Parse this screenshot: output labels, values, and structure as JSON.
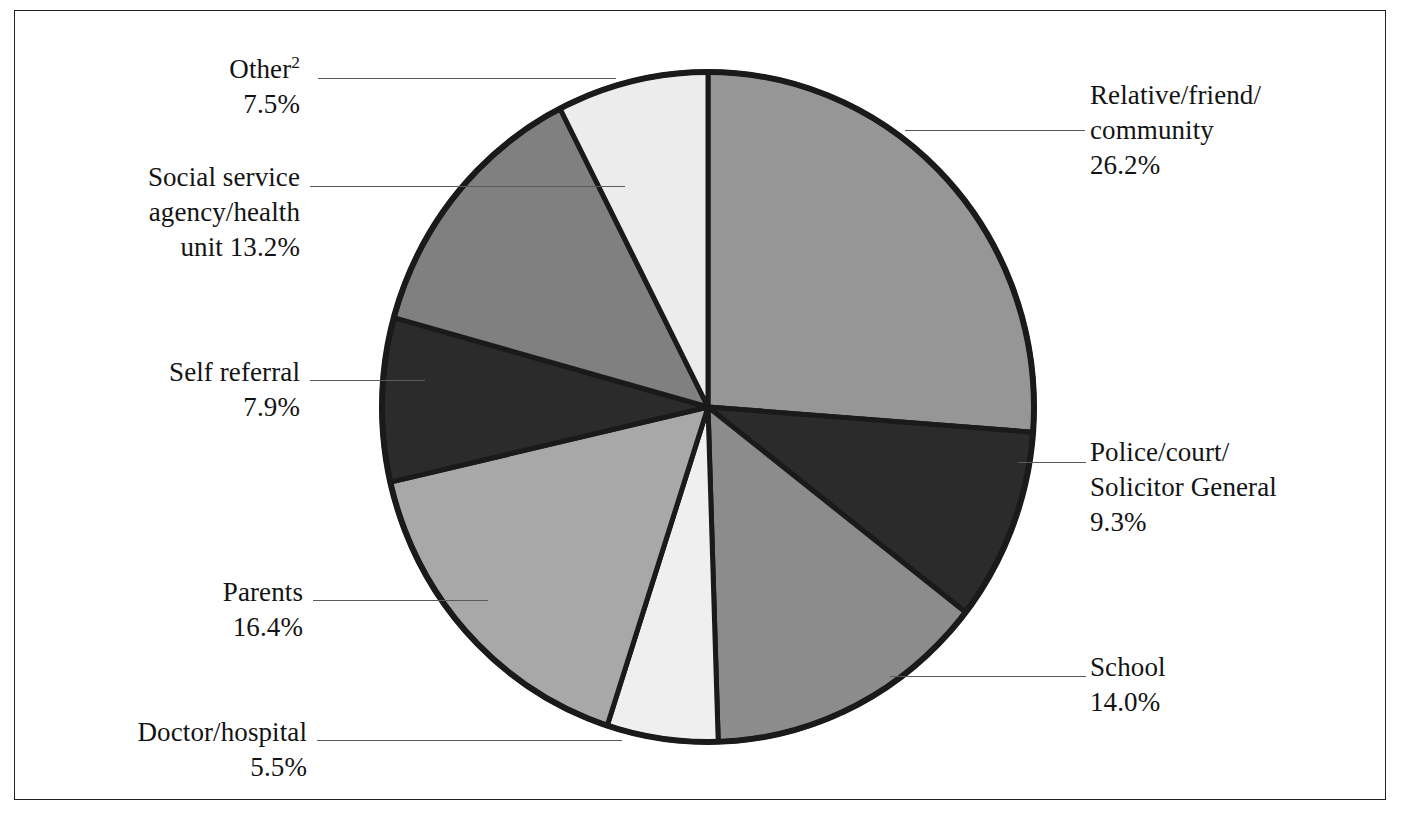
{
  "chart_data": {
    "type": "pie",
    "title": "",
    "subtitle": "",
    "xlabel": "",
    "ylabel": "",
    "legend_position": "callout-labels",
    "grid": false,
    "start_angle_deg": 0,
    "direction": "clockwise",
    "units": "percent",
    "total": 100.0,
    "categories": [
      "Relative/friend/community",
      "Police/court/Solicitor General",
      "School",
      "Doctor/hospital",
      "Parents",
      "Self referral",
      "Social service agency/health unit",
      "Other"
    ],
    "values": [
      26.2,
      9.3,
      14.0,
      5.5,
      16.4,
      7.9,
      13.2,
      7.5
    ],
    "colors": [
      "#969696",
      "#2b2b2b",
      "#8c8c8c",
      "#efefef",
      "#a8a8a8",
      "#2b2b2b",
      "#808080",
      "#ececec"
    ],
    "slices": [
      {
        "name": "relative-friend-community",
        "label_line1": "Relative/friend/",
        "label_line2": "community",
        "value_text": "26.2%",
        "value": 26.2,
        "color": "#969696",
        "side": "right"
      },
      {
        "name": "police-court-solicitor-general",
        "label_line1": "Police/court/",
        "label_line2": "Solicitor General",
        "value_text": "9.3%",
        "value": 9.3,
        "color": "#2b2b2b",
        "side": "right"
      },
      {
        "name": "school",
        "label_line1": "School",
        "label_line2": "",
        "value_text": "14.0%",
        "value": 14.0,
        "color": "#8c8c8c",
        "side": "right"
      },
      {
        "name": "doctor-hospital",
        "label_line1": "Doctor/hospital",
        "label_line2": "",
        "value_text": "5.5%",
        "value": 5.5,
        "color": "#efefef",
        "side": "left"
      },
      {
        "name": "parents",
        "label_line1": "Parents",
        "label_line2": "",
        "value_text": "16.4%",
        "value": 16.4,
        "color": "#a8a8a8",
        "side": "left"
      },
      {
        "name": "self-referral",
        "label_line1": "Self referral",
        "label_line2": "",
        "value_text": "7.9%",
        "value": 7.9,
        "color": "#2b2b2b",
        "side": "left"
      },
      {
        "name": "social-service-agency-health-unit",
        "label_line1": "Social service",
        "label_line2": "agency/health",
        "label_line3": "unit 13.2%",
        "value_text": "13.2%",
        "value": 13.2,
        "color": "#808080",
        "side": "left"
      },
      {
        "name": "other",
        "label_line1": "Other",
        "label_line2": "",
        "value_text": "7.5%",
        "value": 7.5,
        "color": "#ececec",
        "side": "left",
        "footnote_marker": "2"
      }
    ]
  },
  "labels": {
    "relative": {
      "line1": "Relative/friend/",
      "line2": "community",
      "pct": "26.2%"
    },
    "police": {
      "line1": "Police/court/",
      "line2": "Solicitor General",
      "pct": "9.3%"
    },
    "school": {
      "line1": "School",
      "pct": "14.0%"
    },
    "doctor": {
      "line1": "Doctor/hospital",
      "pct": "5.5%"
    },
    "parents": {
      "line1": "Parents",
      "pct": "16.4%"
    },
    "self": {
      "line1": "Self referral",
      "pct": "7.9%"
    },
    "social": {
      "line1": "Social service",
      "line2": "agency/health",
      "line3": "unit 13.2%"
    },
    "other": {
      "line1": "Other",
      "marker": "2",
      "pct": "7.5%"
    }
  }
}
